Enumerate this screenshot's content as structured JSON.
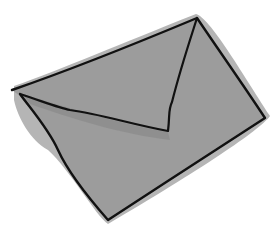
{
  "image": {
    "subject": "Hand-drawn envelope sketch",
    "icon": "envelope-icon",
    "colors": {
      "background": "#ffffff",
      "fill": "#9c9c9c",
      "shadow": "#8a8a8a",
      "halo": "#b5b5b5",
      "outline": "#111111"
    }
  }
}
